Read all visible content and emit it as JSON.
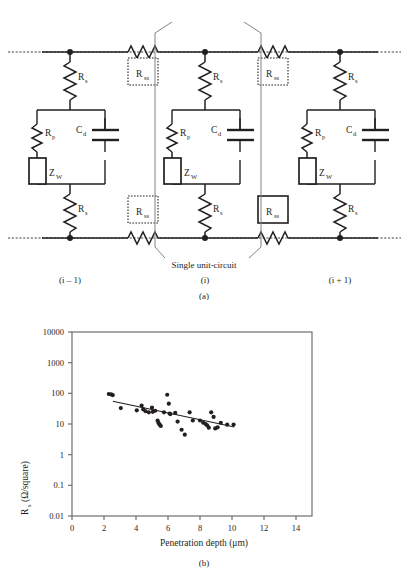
{
  "figure": {
    "panel_a": {
      "caption": "(a)",
      "bracket_label": "Single unit-circuit",
      "units": [
        {
          "index_label": "(i – 1)",
          "name": "unit-left"
        },
        {
          "index_label": "(i)",
          "name": "unit-center"
        },
        {
          "index_label": "(i + 1)",
          "name": "unit-right"
        }
      ],
      "components": {
        "series_resistor": {
          "label": "R",
          "sub": "s"
        },
        "sheet_resistor": {
          "label": "R",
          "sub": "ss"
        },
        "polarization_resistor": {
          "label": "R",
          "sub": "p"
        },
        "double_layer_capacitor": {
          "label": "C",
          "sub": "d"
        },
        "warburg_impedance": {
          "label": "Z",
          "sub": "W"
        }
      },
      "colors": {
        "wire": "#231f20",
        "rail": "#6d6e71",
        "box": "#231f20"
      }
    },
    "panel_b": {
      "caption": "(b)"
    }
  },
  "chart_data": {
    "type": "scatter",
    "title": "",
    "xlabel": "Penetration depth (μm)",
    "ylabel": "R_s (Ω/square)",
    "ylabel_parts": {
      "main": "R",
      "sub": "s",
      "rest": " (Ω/square)"
    },
    "xlim": [
      0,
      15
    ],
    "ylim": [
      0.01,
      10000
    ],
    "yscale": "log",
    "xscale": "linear",
    "grid": false,
    "legend": null,
    "xticks": [
      0,
      2,
      4,
      6,
      8,
      10,
      12,
      14
    ],
    "xticklabels": [
      "0",
      "2",
      "4",
      "6",
      "8",
      "10",
      "12",
      "14"
    ],
    "yticks": [
      0.01,
      0.1,
      1,
      10,
      100,
      1000,
      10000
    ],
    "yticklabels": [
      "0.01",
      "0.1",
      "1",
      "10",
      "100",
      "1000",
      "10000"
    ],
    "points": [
      {
        "x": 2.3,
        "y": 95
      },
      {
        "x": 2.45,
        "y": 92
      },
      {
        "x": 2.55,
        "y": 88
      },
      {
        "x": 3.05,
        "y": 33
      },
      {
        "x": 4.05,
        "y": 28
      },
      {
        "x": 4.35,
        "y": 40
      },
      {
        "x": 4.45,
        "y": 30
      },
      {
        "x": 4.6,
        "y": 26
      },
      {
        "x": 4.8,
        "y": 24
      },
      {
        "x": 5.0,
        "y": 34
      },
      {
        "x": 5.05,
        "y": 25
      },
      {
        "x": 5.2,
        "y": 27
      },
      {
        "x": 5.35,
        "y": 13
      },
      {
        "x": 5.4,
        "y": 11
      },
      {
        "x": 5.45,
        "y": 10
      },
      {
        "x": 5.5,
        "y": 9.2
      },
      {
        "x": 5.55,
        "y": 8.6
      },
      {
        "x": 5.75,
        "y": 24
      },
      {
        "x": 5.95,
        "y": 90
      },
      {
        "x": 6.05,
        "y": 46
      },
      {
        "x": 6.1,
        "y": 22
      },
      {
        "x": 6.15,
        "y": 21
      },
      {
        "x": 6.45,
        "y": 23
      },
      {
        "x": 6.6,
        "y": 12
      },
      {
        "x": 6.85,
        "y": 6.5
      },
      {
        "x": 7.05,
        "y": 4.5
      },
      {
        "x": 7.35,
        "y": 24
      },
      {
        "x": 7.55,
        "y": 13
      },
      {
        "x": 8.0,
        "y": 13
      },
      {
        "x": 8.2,
        "y": 11
      },
      {
        "x": 8.35,
        "y": 10
      },
      {
        "x": 8.45,
        "y": 9.0
      },
      {
        "x": 8.55,
        "y": 7.6
      },
      {
        "x": 8.7,
        "y": 24
      },
      {
        "x": 8.85,
        "y": 17
      },
      {
        "x": 8.95,
        "y": 7.2
      },
      {
        "x": 9.1,
        "y": 7.8
      },
      {
        "x": 9.3,
        "y": 11
      },
      {
        "x": 9.7,
        "y": 9.5
      },
      {
        "x": 10.1,
        "y": 9.6
      }
    ],
    "trendline": {
      "x0": 2.55,
      "y0": 55,
      "x1": 10.15,
      "y1": 8.0
    }
  }
}
